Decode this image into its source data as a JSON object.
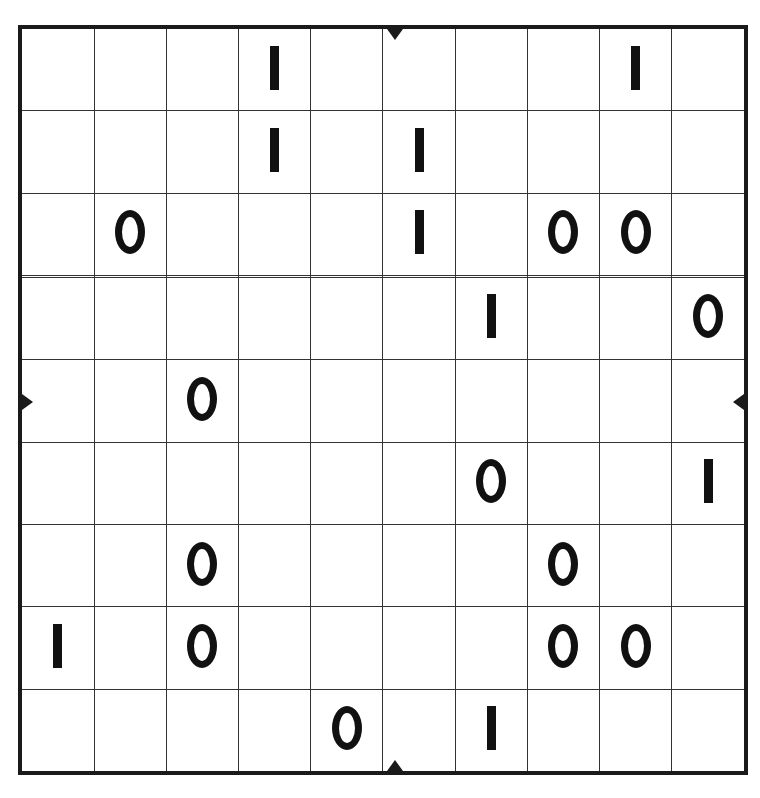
{
  "puzzle": {
    "type": "binary-puzzle",
    "title": "Binary Puzzle",
    "rows": 10,
    "columns": 10,
    "symbols": {
      "zero": "O",
      "one": "I",
      "empty": ""
    },
    "colors": {
      "background": "#ffffff",
      "grid_line": "#333333",
      "frame": "#1a1a1a",
      "glyph": "#111111"
    },
    "edge_markers": {
      "top": "center-division-tick",
      "bottom": "center-division-tick",
      "left": "center-division-tick",
      "right": "center-division-tick",
      "position_after_cell": 5
    },
    "grid": [
      [
        "",
        "",
        "",
        "I",
        "",
        "",
        "",
        "",
        "I",
        ""
      ],
      [
        "",
        "",
        "",
        "I",
        "",
        "I",
        "",
        "",
        "",
        ""
      ],
      [
        "",
        "O",
        "",
        "",
        "",
        "I",
        "",
        "O",
        "O",
        ""
      ],
      [
        "",
        "",
        "",
        "",
        "",
        "",
        "",
        "",
        "",
        ""
      ],
      [
        "",
        "",
        "",
        "",
        "",
        "",
        "I",
        "",
        "",
        "O"
      ],
      [
        "",
        "",
        "O",
        "",
        "",
        "",
        "",
        "",
        "",
        ""
      ],
      [
        "",
        "",
        "",
        "",
        "",
        "",
        "O",
        "",
        "",
        "I"
      ],
      [
        "",
        "",
        "O",
        "",
        "",
        "",
        "",
        "O",
        "",
        ""
      ],
      [
        "I",
        "",
        "O",
        "",
        "",
        "",
        "",
        "O",
        "O",
        ""
      ],
      [
        "",
        "",
        "",
        "",
        "O",
        "",
        "I",
        "",
        "",
        ""
      ]
    ],
    "given_counts": {
      "zeros": 12,
      "ones": 9,
      "filled": 21,
      "empty": 79
    }
  }
}
